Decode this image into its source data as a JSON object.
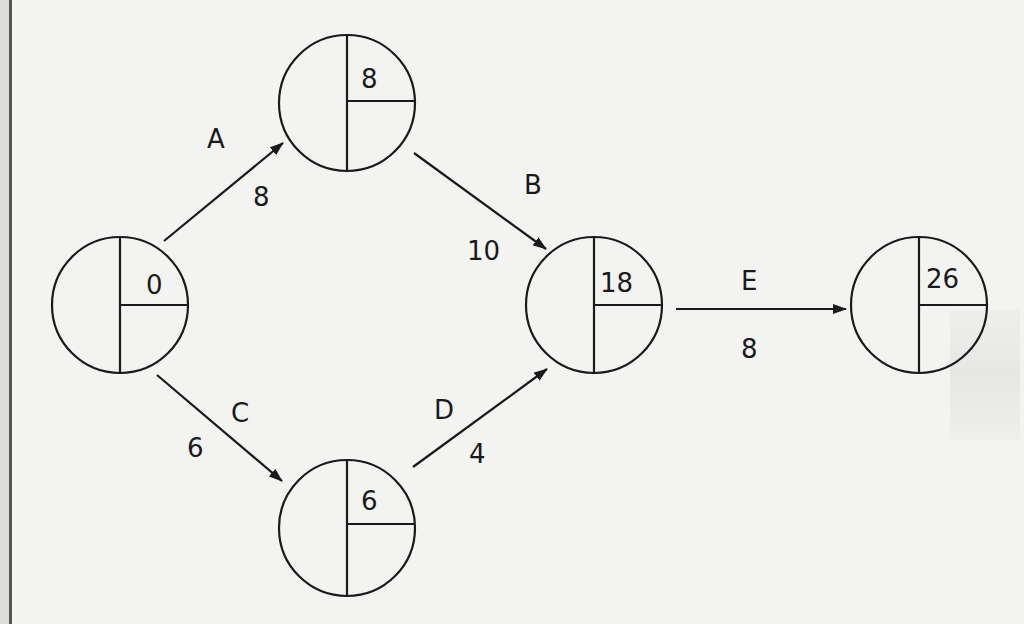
{
  "diagram": {
    "type": "activity-on-node critical path network (forward pass)",
    "nodes": [
      {
        "id": "n1",
        "earliest_time": "0",
        "cx": 120,
        "cy": 305
      },
      {
        "id": "n2",
        "earliest_time": "8",
        "cx": 347,
        "cy": 103
      },
      {
        "id": "n3",
        "earliest_time": "18",
        "cx": 594,
        "cy": 305
      },
      {
        "id": "n4",
        "earliest_time": "6",
        "cx": 347,
        "cy": 528
      },
      {
        "id": "n5",
        "earliest_time": "26",
        "cx": 919,
        "cy": 305
      }
    ],
    "activities": [
      {
        "name": "A",
        "duration": "8",
        "from": "n1",
        "to": "n2"
      },
      {
        "name": "B",
        "duration": "10",
        "from": "n2",
        "to": "n3"
      },
      {
        "name": "C",
        "duration": "6",
        "from": "n1",
        "to": "n4"
      },
      {
        "name": "D",
        "duration": "4",
        "from": "n4",
        "to": "n3"
      },
      {
        "name": "E",
        "duration": "8",
        "from": "n3",
        "to": "n5"
      }
    ],
    "colors": {
      "line": "#1a1a1a",
      "paper": "#f3f3f1",
      "margin_rule": "#555555"
    }
  }
}
